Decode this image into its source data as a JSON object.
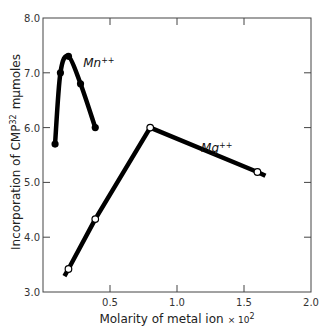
{
  "chart_data": {
    "type": "line",
    "title": "",
    "xlabel": "Molarity of metal ion",
    "xlabel_suffix": "× 10",
    "xlabel_exponent": "2",
    "ylabel": "Incorporation of CMP",
    "ylabel_superscript": "32",
    "ylabel_unit": "mμmoles",
    "xlim": [
      0,
      2.0
    ],
    "ylim": [
      3.0,
      8.0
    ],
    "xticks": [
      0.5,
      1.0,
      1.5,
      2.0
    ],
    "xtick_labels": [
      "0.5",
      "1.0",
      "1.5",
      "2.0"
    ],
    "yticks": [
      3.0,
      4.0,
      5.0,
      6.0,
      7.0,
      8.0
    ],
    "ytick_labels": [
      "3.0",
      "4.0",
      "5.0",
      "6.0",
      "7.0",
      "8.0"
    ],
    "grid": false,
    "legend": "none (inline series labels)",
    "series": [
      {
        "name": "Mn++",
        "label": "Mn",
        "label_sup": "++",
        "marker": "filled-circle",
        "points": [
          {
            "x": 0.09,
            "y": 5.7
          },
          {
            "x": 0.13,
            "y": 7.0
          },
          {
            "x": 0.19,
            "y": 7.3
          },
          {
            "x": 0.28,
            "y": 6.8
          },
          {
            "x": 0.39,
            "y": 6.0
          }
        ],
        "label_pos": {
          "x": 0.3,
          "y": 7.1
        }
      },
      {
        "name": "Mg++",
        "label": "Mg",
        "label_sup": "++",
        "marker": "open-circle",
        "points": [
          {
            "x": 0.19,
            "y": 3.42
          },
          {
            "x": 0.39,
            "y": 4.33
          },
          {
            "x": 0.8,
            "y": 6.0
          },
          {
            "x": 1.6,
            "y": 5.19
          }
        ],
        "line_extent": {
          "start": {
            "x": 0.16,
            "y": 3.29
          },
          "end": {
            "x": 1.66,
            "y": 5.12
          }
        },
        "label_pos": {
          "x": 1.18,
          "y": 5.55
        }
      }
    ]
  }
}
